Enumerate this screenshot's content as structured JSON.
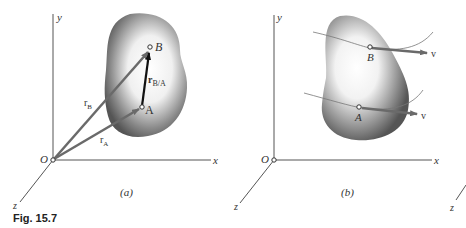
{
  "figure": {
    "caption": "Fig. 15.7",
    "panels": [
      {
        "id": "a",
        "label": "(a)",
        "axes": {
          "x": "x",
          "y": "y",
          "z": "z",
          "origin": "O"
        },
        "points": {
          "A": "A",
          "B": "B"
        },
        "vectors": {
          "rA": "r",
          "rA_sub": "A",
          "rB": "r",
          "rB_sub": "B",
          "rBA": "r",
          "rBA_sub": "B/A"
        }
      },
      {
        "id": "b",
        "label": "(b)",
        "axes": {
          "x": "x",
          "y": "y",
          "z": "z",
          "origin": "O"
        },
        "points": {
          "A": "A",
          "B": "B"
        },
        "vectors": {
          "vA": "v",
          "vB": "v"
        }
      }
    ],
    "extra_axis_label": "z"
  },
  "colors": {
    "axis": "#555555",
    "vector_gray": "#6a6a6a",
    "vector_dark": "#111111",
    "body_dark": "#555555",
    "body_light": "#ffffff"
  }
}
